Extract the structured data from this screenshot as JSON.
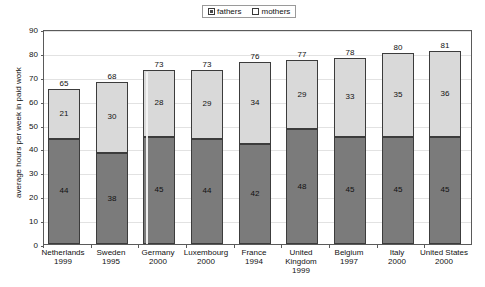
{
  "chart_data": {
    "type": "bar",
    "subtype": "stacked-vertical",
    "title": "",
    "xlabel": "",
    "ylabel": "average hours per week in paid work",
    "ylim": [
      0,
      90
    ],
    "yticks": [
      0,
      10,
      20,
      30,
      40,
      50,
      60,
      70,
      80,
      90
    ],
    "grid": true,
    "legend_position": "top-right",
    "categories": [
      "Netherlands\n1999",
      "Sweden\n1995",
      "Germany\n2000",
      "Luxembourg\n2000",
      "France\n1994",
      "United\nKingdom\n1999",
      "Belgium\n1997",
      "Italy\n2000",
      "United\nStates\n2000"
    ],
    "category_names": [
      "Netherlands",
      "Sweden",
      "Germany",
      "Luxembourg",
      "France",
      "United Kingdom",
      "Belgium",
      "Italy",
      "United States"
    ],
    "category_years": [
      "1999",
      "1995",
      "2000",
      "2000",
      "1994",
      "1999",
      "1997",
      "2000",
      "2000"
    ],
    "series": [
      {
        "name": "fathers",
        "values": [
          44,
          38,
          45,
          44,
          42,
          48,
          45,
          45,
          45
        ],
        "color": "#7b7b7b"
      },
      {
        "name": "mothers",
        "values": [
          21,
          30,
          28,
          29,
          34,
          29,
          33,
          35,
          36
        ],
        "color": "#d9d9d9"
      }
    ],
    "totals": [
      65,
      68,
      73,
      73,
      76,
      77,
      78,
      80,
      81
    ]
  },
  "legend": {
    "entries": [
      {
        "label": "fathers"
      },
      {
        "label": "mothers"
      }
    ]
  },
  "axis": {
    "y_title": "average hours per week in paid work",
    "y_tick_labels": [
      "90",
      "80",
      "70",
      "60",
      "50",
      "40",
      "30",
      "20",
      "10",
      "0"
    ]
  },
  "bars": [
    {
      "name": "Netherlands",
      "year": "1999",
      "fathers": "44",
      "mothers": "21",
      "total": "65"
    },
    {
      "name": "Sweden",
      "year": "1995",
      "fathers": "38",
      "mothers": "30",
      "total": "68"
    },
    {
      "name": "Germany",
      "year": "2000",
      "fathers": "45",
      "mothers": "28",
      "total": "73"
    },
    {
      "name": "Luxembourg",
      "year": "2000",
      "fathers": "44",
      "mothers": "29",
      "total": "73"
    },
    {
      "name": "France",
      "year": "1994",
      "fathers": "42",
      "mothers": "34",
      "total": "76"
    },
    {
      "name": "United Kingdom",
      "year": "1999",
      "fathers": "48",
      "mothers": "29",
      "total": "77"
    },
    {
      "name": "Belgium",
      "year": "1997",
      "fathers": "45",
      "mothers": "33",
      "total": "78"
    },
    {
      "name": "Italy",
      "year": "2000",
      "fathers": "45",
      "mothers": "35",
      "total": "80"
    },
    {
      "name": "United States",
      "year": "2000",
      "fathers": "45",
      "mothers": "36",
      "total": "81"
    }
  ],
  "colors": {
    "fathers": "#7b7b7b",
    "mothers": "#d9d9d9",
    "axis": "#5a5a5a",
    "grid": "#e2e2e2",
    "text": "#111111"
  }
}
